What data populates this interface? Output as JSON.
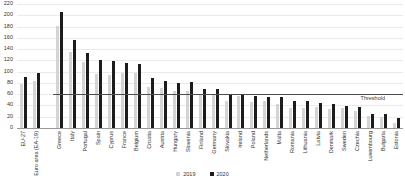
{
  "chart_data": {
    "type": "bar",
    "title": "",
    "categories": [
      "EU-27",
      "Euro area (EA-19)",
      "Greece",
      "Italy",
      "Portugal",
      "Spain",
      "Cyprus",
      "France",
      "Belgium",
      "Croatia",
      "Austria",
      "Hungary",
      "Slovenia",
      "Finland",
      "Germany",
      "Slovakia",
      "Ireland",
      "Poland",
      "Netherlands",
      "Malta",
      "Romania",
      "Lithuania",
      "Latvia",
      "Denmark",
      "Sweden",
      "Czechia",
      "Luxembourg",
      "Bulgaria",
      "Estonia"
    ],
    "series": [
      {
        "name": "2019",
        "color": "#d4d4d4",
        "values": [
          77.5,
          83.9,
          180.5,
          134.6,
          116.8,
          95.5,
          94.0,
          97.6,
          98.1,
          72.8,
          70.5,
          65.4,
          65.6,
          59.5,
          59.7,
          48.2,
          57.4,
          45.6,
          48.7,
          42.0,
          35.3,
          35.9,
          37.0,
          33.3,
          35.0,
          30.3,
          22.1,
          20.2,
          8.4
        ]
      },
      {
        "name": "2020",
        "color": "#1c1c1c",
        "values": [
          90.7,
          98.0,
          205.6,
          155.8,
          133.6,
          120.0,
          118.2,
          115.7,
          114.1,
          88.7,
          83.9,
          80.4,
          80.8,
          69.2,
          69.8,
          60.6,
          59.5,
          57.5,
          54.5,
          54.3,
          47.3,
          47.3,
          43.5,
          42.2,
          39.9,
          38.1,
          24.9,
          25.0,
          18.2
        ]
      }
    ],
    "xlabel": "",
    "ylabel": "",
    "ylim": [
      0,
      220
    ],
    "ytick_step": 20,
    "grid": true,
    "legend_position": "bottom-center",
    "threshold": {
      "value": 60,
      "label": "Threshold"
    },
    "gap_after_category_index": 1
  },
  "colors": {
    "background": "#ffffff",
    "gridline": "#eaeaea",
    "axis": "#999999",
    "threshold_line": "#4d4d4d",
    "text": "#333333"
  }
}
